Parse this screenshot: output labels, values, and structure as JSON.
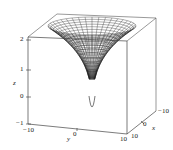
{
  "chart_data": {
    "type": "surface3d",
    "title": "",
    "xlabel": "x",
    "ylabel": "y",
    "zlabel": "z",
    "x_ticks": [
      "-10",
      "0",
      "10"
    ],
    "y_ticks": [
      "-10",
      "0",
      "10"
    ],
    "z_ticks": [
      "-1",
      "0",
      "1",
      "2"
    ],
    "xlim": [
      -10,
      10
    ],
    "ylim": [
      -10,
      10
    ],
    "zlim": [
      -1,
      2.3
    ],
    "grid": false,
    "box": true,
    "surface": {
      "shape": "funnel (radially symmetric)",
      "rim_radius": 10,
      "rim_z": 2.3,
      "tip_z": -0.5,
      "mesh": "wireframe, dark lines"
    }
  },
  "labels": {
    "z_axis": "z",
    "y_axis": "y",
    "x_axis": "x",
    "z_tick_2": "2",
    "z_tick_1": "1",
    "z_tick_0": "0",
    "z_tick_m1": "−1",
    "y_tick_m10": "−10",
    "y_tick_0": "0",
    "y_tick_10": "10",
    "x_tick_10": "10",
    "x_tick_0": "0",
    "x_tick_m10": "−10"
  },
  "colors": {
    "axis": "#333333",
    "mesh": "#1a1a1a",
    "background": "#ffffff"
  }
}
